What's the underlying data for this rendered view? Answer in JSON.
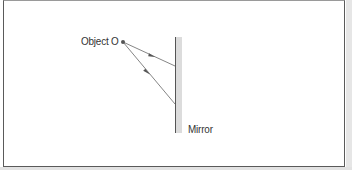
{
  "diagram": {
    "labels": {
      "object": "Object O",
      "mirror": "Mirror"
    },
    "object_point": {
      "x": 123,
      "y": 42
    },
    "mirror": {
      "x": 176,
      "y_top": 37,
      "y_bottom": 133,
      "thickness": 6
    },
    "rays": [
      {
        "from": [
          123,
          42
        ],
        "to": [
          175,
          66
        ],
        "arrow_at": 0.55
      },
      {
        "from": [
          123,
          42
        ],
        "to": [
          175,
          104
        ],
        "arrow_at": 0.45
      }
    ],
    "colors": {
      "line": "#555555",
      "mirror_shade": "#d9d9d9",
      "text": "#333333",
      "border": "#5a5a5a"
    }
  }
}
